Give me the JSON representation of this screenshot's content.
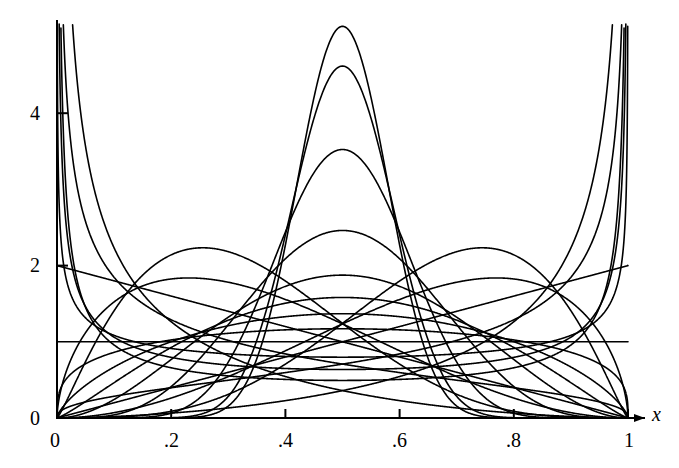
{
  "chart_data": {
    "type": "line",
    "title": "",
    "subtitle": "",
    "xlabel": "x",
    "ylabel": "",
    "xlim": [
      0,
      1
    ],
    "ylim": [
      0,
      5.4
    ],
    "grid": false,
    "legend": false,
    "legend_position": "none",
    "xticks": [
      0,
      0.2,
      0.4,
      0.6,
      0.8,
      1
    ],
    "xticklabels": [
      "0",
      ".2",
      ".4",
      ".6",
      ".8",
      "1"
    ],
    "yticks": [
      0,
      2,
      4
    ],
    "yticklabels": [
      "0",
      "2",
      "4"
    ],
    "axis_color": "#000000",
    "curve_color": "#000000",
    "curve_width": 1.6,
    "series": [
      {
        "name": "Beta(0.35,0.35)",
        "a": 0.35,
        "b": 0.35,
        "peak_x": null,
        "peak_y": null,
        "shape": "u-shaped"
      },
      {
        "name": "Beta(0.5,0.5)",
        "a": 0.5,
        "b": 0.5,
        "peak_x": null,
        "peak_y": null,
        "shape": "u-shaped"
      },
      {
        "name": "Beta(0.7,0.7)",
        "a": 0.7,
        "b": 0.7,
        "peak_x": null,
        "peak_y": null,
        "shape": "u-shaped"
      },
      {
        "name": "Beta(1,1)",
        "a": 1.0,
        "b": 1.0,
        "peak_x": 0.5,
        "peak_y": 1.0,
        "shape": "uniform"
      },
      {
        "name": "Beta(1.3,1.3)",
        "a": 1.3,
        "b": 1.3,
        "peak_x": 0.5,
        "peak_y": 1.16,
        "shape": "unimodal"
      },
      {
        "name": "Beta(1.7,1.7)",
        "a": 1.7,
        "b": 1.7,
        "peak_x": 0.5,
        "peak_y": 1.36,
        "shape": "unimodal"
      },
      {
        "name": "Beta(2.2,2.2)",
        "a": 2.2,
        "b": 2.2,
        "peak_x": 0.5,
        "peak_y": 1.57,
        "shape": "unimodal"
      },
      {
        "name": "Beta(3,3)",
        "a": 3.0,
        "b": 3.0,
        "peak_x": 0.5,
        "peak_y": 1.88,
        "shape": "unimodal"
      },
      {
        "name": "Beta(5,5)",
        "a": 5.0,
        "b": 5.0,
        "peak_x": 0.5,
        "peak_y": 2.46,
        "shape": "unimodal"
      },
      {
        "name": "Beta(10,10)",
        "a": 10.0,
        "b": 10.0,
        "peak_x": 0.5,
        "peak_y": 3.52,
        "shape": "unimodal"
      },
      {
        "name": "Beta(17,17)",
        "a": 17.0,
        "b": 17.0,
        "peak_x": 0.5,
        "peak_y": 4.54,
        "shape": "unimodal"
      },
      {
        "name": "Beta(21,21)",
        "a": 21.0,
        "b": 21.0,
        "peak_x": 0.5,
        "peak_y": 5.05,
        "shape": "unimodal"
      },
      {
        "name": "Beta(2,1)",
        "a": 2.0,
        "b": 1.0,
        "peak_x": 1.0,
        "peak_y": 2.0,
        "shape": "increasing"
      },
      {
        "name": "Beta(1,2)",
        "a": 1.0,
        "b": 2.0,
        "peak_x": 0.0,
        "peak_y": 2.0,
        "shape": "decreasing"
      },
      {
        "name": "Beta(3,1.6)",
        "a": 3.0,
        "b": 1.6,
        "peak_x": 0.77,
        "peak_y": 1.92,
        "shape": "right-peaked"
      },
      {
        "name": "Beta(1.6,3)",
        "a": 1.6,
        "b": 3.0,
        "peak_x": 0.23,
        "peak_y": 1.92,
        "shape": "left-peaked"
      },
      {
        "name": "Beta(4.5,2.2)",
        "a": 4.5,
        "b": 2.2,
        "peak_x": 0.74,
        "peak_y": 2.28,
        "shape": "right-peaked"
      },
      {
        "name": "Beta(2.2,4.5)",
        "a": 2.2,
        "b": 4.5,
        "peak_x": 0.26,
        "peak_y": 2.28,
        "shape": "left-peaked"
      },
      {
        "name": "Beta(0.55,1.4)",
        "a": 0.55,
        "b": 1.4,
        "peak_x": 0.0,
        "peak_y": null,
        "shape": "left-divergent"
      },
      {
        "name": "Beta(1.4,0.55)",
        "a": 1.4,
        "b": 0.55,
        "peak_x": 1.0,
        "peak_y": null,
        "shape": "right-divergent"
      },
      {
        "name": "Beta(0.45,2.6)",
        "a": 0.45,
        "b": 2.6,
        "peak_x": 0.0,
        "peak_y": null,
        "shape": "left-divergent"
      },
      {
        "name": "Beta(2.6,0.45)",
        "a": 2.6,
        "b": 0.45,
        "peak_x": 1.0,
        "peak_y": null,
        "shape": "right-divergent"
      }
    ]
  },
  "axes": {
    "x_axis_label": "x",
    "y_axis_label": "",
    "x_tick_labels": [
      "0",
      ".2",
      ".4",
      ".6",
      ".8",
      "1"
    ],
    "y_tick_labels": [
      "0",
      "2",
      "4"
    ],
    "origin_label": "0"
  }
}
